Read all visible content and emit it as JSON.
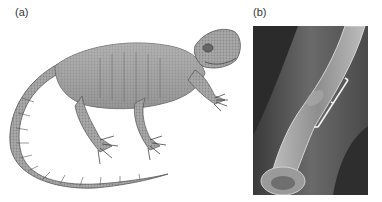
{
  "figure": {
    "panels": [
      {
        "label": "(a)",
        "content": "illustration of a lizard-like reptile"
      },
      {
        "label": "(b)",
        "content": "X-ray radiograph of a bone with bracket marking a region"
      }
    ]
  },
  "colors": {
    "background": "#ffffff",
    "xray_dark": "#2a2a2a",
    "xray_mid": "#6e6e6e",
    "bone": "#c8c8c8",
    "bracket": "#f2f2f2"
  }
}
